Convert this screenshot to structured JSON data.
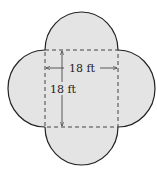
{
  "diagram": {
    "shape_fill": "#e4e4e4",
    "outline_color": "#222222",
    "square": {
      "style": "dashed",
      "side_label_horizontal": "18 ft",
      "side_label_vertical": "18 ft"
    },
    "semicircles": [
      "top",
      "right",
      "bottom",
      "left"
    ]
  }
}
